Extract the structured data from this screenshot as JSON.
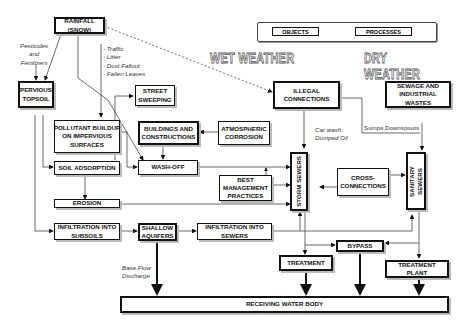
{
  "legend": {
    "objects_label": "OBJECTS",
    "processes_label": "PROCESSES"
  },
  "section_titles": {
    "wet_weather": "WET WEATHER",
    "dry_weather": "DRY WEATHER"
  },
  "nodes": {
    "rainfall": "RAINFALL\n(SNOW)",
    "pervious_topsoil": "PERVIOUS\nTOPSOIL",
    "street_sweeping": "STREET\nSWEEPING",
    "pollutant_buildup": "POLLUTANT BUILDUP\nON IMPERVIOUS\nSURFACES",
    "buildings": "BUILDINGS AND\nCONSTRUCTIONS",
    "atmospheric_corrosion": "ATMOSPHERIC\nCORROSION",
    "soil_adsorption": "SOIL ADSORPTION",
    "wash_off": "WASH-OFF",
    "erosion": "EROSION",
    "bmp": "BEST\nMANAGEMENT\nPRACTICES",
    "illegal_connections": "ILLEGAL\nCONNECTIONS",
    "sewage": "SEWAGE AND\nINDUSTRIAL\nWASTES",
    "storm_sewers": "STORM SEWERS",
    "sanitary_sewers": "SANITARY\nSEWERS",
    "cross_connections": "CROSS-\nCONNECTIONS",
    "infiltration_subsoils": "INFILTRATION INTO\nSUBSOILS",
    "shallow_aquifers": "SHALLOW\nAQUIFERS",
    "infiltration_sewers": "INFILTRATION INTO\nSEWERS",
    "bypass": "BYPASS",
    "treatment": "TREATMENT",
    "treatment_plant": "TREATMENT PLANT",
    "receiving_water": "RECEIVING WATER BODY"
  },
  "annotations": {
    "pesticides": "Pesticides\nand\nFertilizers",
    "traffic_list": "- Traffic\n- Litter\n- Dust Fallout\n- Fallen Leaves",
    "car_wash": "Car wash,\nDumped Oil",
    "sumps": "Sumps,Downspouts",
    "base_flow": "Base Flow\nDischarge"
  }
}
